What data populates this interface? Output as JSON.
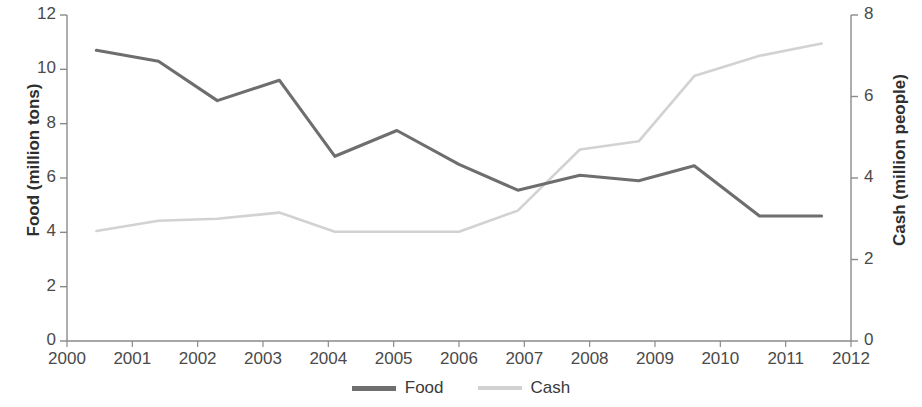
{
  "chart_data": {
    "type": "line",
    "title": "",
    "xlabel": "",
    "ylabel": "Food (million tons)",
    "y2label": "Cash (million people)",
    "xlim": [
      2000,
      2012
    ],
    "ylim": [
      0,
      12
    ],
    "y2lim": [
      0,
      8
    ],
    "grid": false,
    "legend_position": "bottom-center",
    "x_ticks": [
      "2000",
      "2001",
      "2002",
      "2003",
      "2004",
      "2005",
      "2006",
      "2007",
      "2008",
      "2009",
      "2010",
      "2011",
      "2012"
    ],
    "y_left_ticks": [
      "0",
      "2",
      "4",
      "6",
      "8",
      "10",
      "12"
    ],
    "y_right_ticks": [
      "0",
      "2",
      "4",
      "6",
      "8"
    ],
    "series": [
      {
        "name": "Food",
        "axis": "left",
        "color": "#6e6e6e",
        "x": [
          2000.45,
          2001.4,
          2002.3,
          2003.25,
          2004.1,
          2005.05,
          2006.0,
          2006.9,
          2007.85,
          2008.75,
          2009.6,
          2010.6,
          2011.55
        ],
        "values": [
          10.7,
          10.3,
          8.85,
          9.6,
          6.8,
          7.75,
          6.5,
          5.55,
          6.1,
          5.9,
          6.45,
          4.6,
          4.6
        ]
      },
      {
        "name": "Cash",
        "axis": "right",
        "color": "#d2d2d2",
        "x": [
          2000.45,
          2001.4,
          2002.3,
          2003.25,
          2004.1,
          2005.05,
          2006.0,
          2006.9,
          2007.85,
          2008.75,
          2009.6,
          2010.6,
          2011.55
        ],
        "values": [
          2.7,
          2.95,
          3.0,
          3.15,
          2.68,
          2.68,
          2.68,
          3.2,
          4.7,
          4.9,
          6.5,
          7.0,
          7.3
        ]
      }
    ]
  },
  "legend": {
    "items": [
      {
        "label": "Food"
      },
      {
        "label": "Cash"
      }
    ]
  },
  "axes": {
    "left_title": "Food (million tons)",
    "right_title": "Cash (million people)"
  }
}
